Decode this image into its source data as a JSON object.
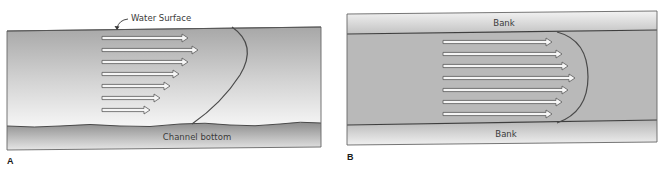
{
  "figure": {
    "panels": [
      {
        "id": "A",
        "letter": "A",
        "view": "side (vertical) velocity profile",
        "labels": {
          "water_surface": "Water Surface",
          "channel_bottom": "Channel bottom"
        },
        "arrows": [
          {
            "y": 38,
            "x_start": 102,
            "x_end": 188
          },
          {
            "y": 50,
            "x_start": 102,
            "x_end": 198
          },
          {
            "y": 62,
            "x_start": 102,
            "x_end": 188
          },
          {
            "y": 74,
            "x_start": 102,
            "x_end": 179
          },
          {
            "y": 86,
            "x_start": 102,
            "x_end": 170
          },
          {
            "y": 98,
            "x_start": 102,
            "x_end": 160
          },
          {
            "y": 110,
            "x_start": 102,
            "x_end": 150
          }
        ]
      },
      {
        "id": "B",
        "letter": "B",
        "view": "plan (horizontal) velocity profile",
        "labels": {
          "top_bank": "Bank",
          "bottom_bank": "Bank"
        },
        "arrows": [
          {
            "y": 42,
            "x_start": 443,
            "x_end": 552
          },
          {
            "y": 54,
            "x_start": 443,
            "x_end": 562
          },
          {
            "y": 66,
            "x_start": 443,
            "x_end": 568
          },
          {
            "y": 78,
            "x_start": 443,
            "x_end": 575
          },
          {
            "y": 90,
            "x_start": 443,
            "x_end": 568
          },
          {
            "y": 102,
            "x_start": 443,
            "x_end": 562
          },
          {
            "y": 114,
            "x_start": 443,
            "x_end": 552
          }
        ]
      }
    ],
    "colors": {
      "water_dark": "#a9a9a9",
      "water_light": "#f2f2f2",
      "bottom_dark": "#8f8f8f",
      "bank_light": "#ececec",
      "outline": "#555555",
      "arrow_fill": "#f5f5f5",
      "arrow_stroke": "#5a5a5a"
    }
  }
}
